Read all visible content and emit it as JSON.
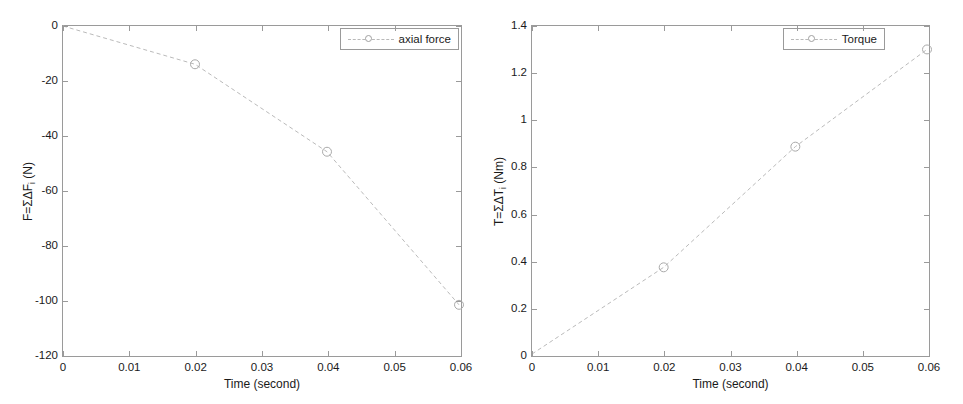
{
  "figure": {
    "background_color": "#ffffff",
    "axis_color": "#9a9a9a",
    "series_color": "#b9b9b9",
    "text_color": "#1a1a1a",
    "panel_count": 2
  },
  "chart_data": [
    {
      "type": "line",
      "id": "axial-force-chart",
      "title": "",
      "xlabel": "Time (second)",
      "ylabel": "F=ΣΔF",
      "ylabel_sub": "i",
      "ylabel_unit": " (N)",
      "ylabel_full": "F=ΣΔFi (N)",
      "xlim": [
        0,
        0.06
      ],
      "ylim": [
        -120,
        0
      ],
      "xticks": [
        0,
        0.01,
        0.02,
        0.03,
        0.04,
        0.05,
        0.06
      ],
      "xticklabels": [
        "0",
        "0.01",
        "0.02",
        "0.03",
        "0.04",
        "0.05",
        "0.06"
      ],
      "yticks": [
        0,
        -20,
        -40,
        -60,
        -80,
        -100,
        -120
      ],
      "yticklabels": [
        "0",
        "-20",
        "-40",
        "-60",
        "-80",
        "-100",
        "-120"
      ],
      "grid": false,
      "legend_position": "top-right",
      "series": [
        {
          "name": "axial force",
          "linestyle": "dashed",
          "marker": "circle",
          "x": [
            0,
            0.02,
            0.04,
            0.06
          ],
          "values": [
            0,
            -14,
            -46,
            -102
          ]
        }
      ]
    },
    {
      "type": "line",
      "id": "torque-chart",
      "title": "",
      "xlabel": "Time (second)",
      "ylabel": "T=ΣΔT",
      "ylabel_sub": "i",
      "ylabel_unit": " (Nm)",
      "ylabel_full": "T=ΣΔTi (Nm)",
      "xlim": [
        0,
        0.06
      ],
      "ylim": [
        0,
        1.4
      ],
      "xticks": [
        0,
        0.01,
        0.02,
        0.03,
        0.04,
        0.05,
        0.06
      ],
      "xticklabels": [
        "0",
        "0.01",
        "0.02",
        "0.03",
        "0.04",
        "0.05",
        "0.06"
      ],
      "yticks": [
        0,
        0.2,
        0.4,
        0.6,
        0.8,
        1,
        1.2,
        1.4
      ],
      "yticklabels": [
        "0",
        "0.2",
        "0.4",
        "0.6",
        "0.8",
        "1",
        "1.2",
        "1.4"
      ],
      "grid": false,
      "legend_position": "top-right",
      "series": [
        {
          "name": "Torque",
          "linestyle": "dashed",
          "marker": "circle",
          "x": [
            0,
            0.02,
            0.04,
            0.06
          ],
          "values": [
            0,
            0.37,
            0.885,
            1.3
          ]
        }
      ]
    }
  ]
}
